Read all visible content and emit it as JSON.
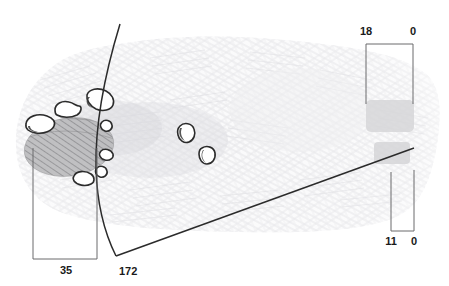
{
  "figure": {
    "background_color": "#ffffff",
    "sketch_texture_color": "#e8e8ea",
    "outline_color": "#2b2b2b",
    "hatch_color": "#5a5a5a",
    "bean_fill_color": "#ffffff",
    "dimension_line_color": "#555555",
    "label_color": "#1a1a1a",
    "block_color": "#d6d6d8"
  },
  "dimensions": {
    "top_right": {
      "name": "top-right-dimension",
      "left_label": "18",
      "right_label": "0"
    },
    "bottom_right": {
      "name": "bottom-right-dimension",
      "left_label": "11",
      "right_label": "0"
    },
    "bottom_left": {
      "name": "bottom-left-dimension",
      "label": "35"
    },
    "curve": {
      "name": "curve-angle-callout",
      "label": "172"
    }
  },
  "annotations": {
    "curve_line": "curved-reference-line",
    "diagonal_line": "diagonal-reference-line"
  },
  "shapes": {
    "hatched_ellipse": "hatched-ellipse-region",
    "beans": [
      {
        "name": "bean-upper-left",
        "cx": 67,
        "cy": 109,
        "rx": 12,
        "ry": 7,
        "rot": -18
      },
      {
        "name": "bean-upper-mid",
        "cx": 100,
        "cy": 102,
        "rx": 13,
        "ry": 8,
        "rot": 24
      },
      {
        "name": "bean-left-large",
        "cx": 41,
        "cy": 124,
        "rx": 15,
        "ry": 8,
        "rot": -14
      },
      {
        "name": "bean-small-upper",
        "cx": 107,
        "cy": 126,
        "rx": 6,
        "ry": 6,
        "rot": 0
      },
      {
        "name": "bean-small-mid",
        "cx": 107,
        "cy": 155,
        "rx": 7,
        "ry": 6,
        "rot": 12
      },
      {
        "name": "bean-small-lower",
        "cx": 102,
        "cy": 172,
        "rx": 6,
        "ry": 6,
        "rot": 0
      },
      {
        "name": "bean-lower-left",
        "cx": 84,
        "cy": 178,
        "rx": 10,
        "ry": 6,
        "rot": -12
      },
      {
        "name": "bean-center-upper",
        "cx": 186,
        "cy": 132,
        "rx": 9,
        "ry": 8,
        "rot": 22
      },
      {
        "name": "bean-center-lower",
        "cx": 208,
        "cy": 155,
        "rx": 8,
        "ry": 8,
        "rot": 30
      }
    ]
  }
}
